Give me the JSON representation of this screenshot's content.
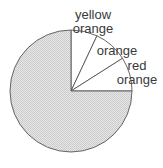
{
  "chart_data": {
    "type": "pie",
    "title": "",
    "start_angle_deg": 0,
    "direction": "clockwise",
    "center": [
      71,
      91
    ],
    "radius": 61,
    "slices": [
      {
        "label": "yellow orange",
        "label_lines": [
          "yellow",
          "orange"
        ],
        "value": 7,
        "fill": "#ffffff",
        "label_pos": [
          93,
          19
        ]
      },
      {
        "label": "orange",
        "label_lines": [
          "orange"
        ],
        "value": 9,
        "fill": "#ffffff",
        "label_pos": [
          117,
          55
        ]
      },
      {
        "label": "red orange",
        "label_lines": [
          "red",
          "orange"
        ],
        "value": 9,
        "fill": "#ffffff",
        "label_pos": [
          137,
          70
        ]
      },
      {
        "label": "",
        "label_lines": [],
        "value": 75,
        "fill": "#d9d9d9",
        "label_pos": null
      }
    ],
    "stroke": "#555555",
    "legend": "none",
    "units": "percent (approximate, read from slice angles)"
  }
}
